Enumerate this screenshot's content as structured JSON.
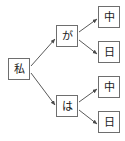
{
  "diagram": {
    "type": "tree",
    "background_color": "#ffffff",
    "node_border_color": "#6e6e6e",
    "node_fill_color": "#ffffff",
    "edge_color": "#595959",
    "text_color": "#1a1a1a",
    "nodes": [
      {
        "id": "root",
        "label": "私",
        "x": 8,
        "y": 58,
        "column": 0
      },
      {
        "id": "ga",
        "label": "が",
        "x": 56,
        "y": 25,
        "column": 1
      },
      {
        "id": "ha",
        "label": "は",
        "x": 56,
        "y": 95,
        "column": 1
      },
      {
        "id": "leaf1",
        "label": "中",
        "x": 98,
        "y": 6,
        "column": 2
      },
      {
        "id": "leaf2",
        "label": "日",
        "x": 98,
        "y": 41,
        "column": 2
      },
      {
        "id": "leaf3",
        "label": "中",
        "x": 98,
        "y": 76,
        "column": 2
      },
      {
        "id": "leaf4",
        "label": "日",
        "x": 98,
        "y": 111,
        "column": 2
      }
    ],
    "edges": [
      {
        "from": "root",
        "to": "ga",
        "x1": 31,
        "y1": 66,
        "x2": 55,
        "y2": 39
      },
      {
        "from": "root",
        "to": "ha",
        "x1": 31,
        "y1": 73,
        "x2": 55,
        "y2": 105
      },
      {
        "from": "ga",
        "to": "leaf1",
        "x1": 79,
        "y1": 32,
        "x2": 97,
        "y2": 19
      },
      {
        "from": "ga",
        "to": "leaf2",
        "x1": 79,
        "y1": 40,
        "x2": 97,
        "y2": 54
      },
      {
        "from": "ha",
        "to": "leaf3",
        "x1": 79,
        "y1": 102,
        "x2": 97,
        "y2": 89
      },
      {
        "from": "ha",
        "to": "leaf4",
        "x1": 79,
        "y1": 110,
        "x2": 97,
        "y2": 124
      }
    ]
  }
}
